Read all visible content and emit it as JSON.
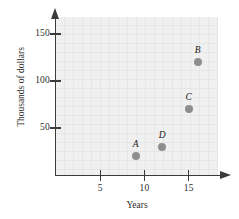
{
  "chart_data": {
    "type": "scatter",
    "title": "",
    "xlabel": "Years",
    "ylabel": "Thousands of dollars",
    "xlim": [
      0,
      18.3
    ],
    "ylim": [
      0,
      168
    ],
    "grid": true,
    "legend": "none",
    "xticks": [
      5,
      10,
      15
    ],
    "xtick_labels": [
      "5",
      "10",
      "15"
    ],
    "yticks": [
      50,
      100,
      150
    ],
    "ytick_labels": [
      "50",
      "100",
      "150"
    ],
    "points": [
      {
        "label": "A",
        "x": 9,
        "y": 20
      },
      {
        "label": "B",
        "x": 16,
        "y": 120
      },
      {
        "label": "C",
        "x": 15,
        "y": 70
      },
      {
        "label": "D",
        "x": 12,
        "y": 30
      }
    ],
    "colors": {
      "marker": "#8e8e8e",
      "plot_background": "#f0f0f0",
      "grid": "#e6e6e6",
      "axis": "#3b3b3b",
      "text": "#2b2b2b"
    }
  }
}
